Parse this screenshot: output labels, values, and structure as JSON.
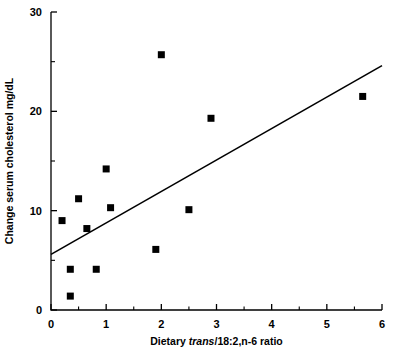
{
  "chart_data": {
    "type": "scatter",
    "title": "",
    "xlabel_parts": [
      {
        "text": "Dietary ",
        "italic": false
      },
      {
        "text": "trans",
        "italic": true
      },
      {
        "text": "/18:2,n-6 ratio",
        "italic": false
      }
    ],
    "xlabel": "Dietary trans/18:2,n-6 ratio",
    "ylabel": "Change serum cholesterol mg/dL",
    "xlim": [
      0,
      6
    ],
    "ylim": [
      0,
      30
    ],
    "x_major_ticks": [
      0,
      1,
      2,
      3,
      4,
      5,
      6
    ],
    "x_minor_ticks": [
      0.5,
      1.5,
      2.5,
      3.5,
      4.5,
      5.5
    ],
    "x_tick_labels": [
      "0",
      "1",
      "2",
      "3",
      "4",
      "5",
      "6"
    ],
    "y_major_ticks": [
      0,
      10,
      20,
      30
    ],
    "y_minor_ticks": [
      5,
      15,
      25
    ],
    "y_tick_labels": [
      "0",
      "10",
      "20",
      "30"
    ],
    "grid": false,
    "legend": null,
    "marker_shape": "square",
    "marker_color": "#000000",
    "marker_size_px": 7,
    "points": [
      {
        "x": 0.2,
        "y": 9.0
      },
      {
        "x": 0.35,
        "y": 1.4
      },
      {
        "x": 0.35,
        "y": 4.1
      },
      {
        "x": 0.5,
        "y": 11.2
      },
      {
        "x": 0.65,
        "y": 8.2
      },
      {
        "x": 0.82,
        "y": 4.1
      },
      {
        "x": 1.0,
        "y": 14.2
      },
      {
        "x": 1.08,
        "y": 10.3
      },
      {
        "x": 1.9,
        "y": 6.1
      },
      {
        "x": 2.0,
        "y": 25.7
      },
      {
        "x": 2.5,
        "y": 10.1
      },
      {
        "x": 2.9,
        "y": 19.3
      },
      {
        "x": 5.65,
        "y": 21.5
      }
    ],
    "series": [
      {
        "name": "trend-line",
        "type": "line",
        "color": "#000000",
        "endpoints": [
          {
            "x": 0.0,
            "y": 5.6
          },
          {
            "x": 6.0,
            "y": 24.6
          }
        ]
      }
    ]
  }
}
